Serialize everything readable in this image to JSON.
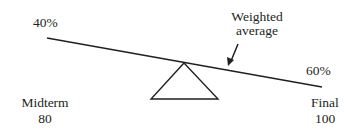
{
  "diagram": {
    "left_weight": "40%",
    "right_weight": "60%",
    "annotation_line1": "Weighted",
    "annotation_line2": "average",
    "left_label": "Midterm",
    "left_value": "80",
    "right_label": "Final",
    "right_value": "100",
    "icons": {
      "fulcrum": "triangle-fulcrum",
      "pointer": "arrow-down-left"
    },
    "colors": {
      "ink": "#231f20",
      "background": "#ffffff"
    }
  }
}
